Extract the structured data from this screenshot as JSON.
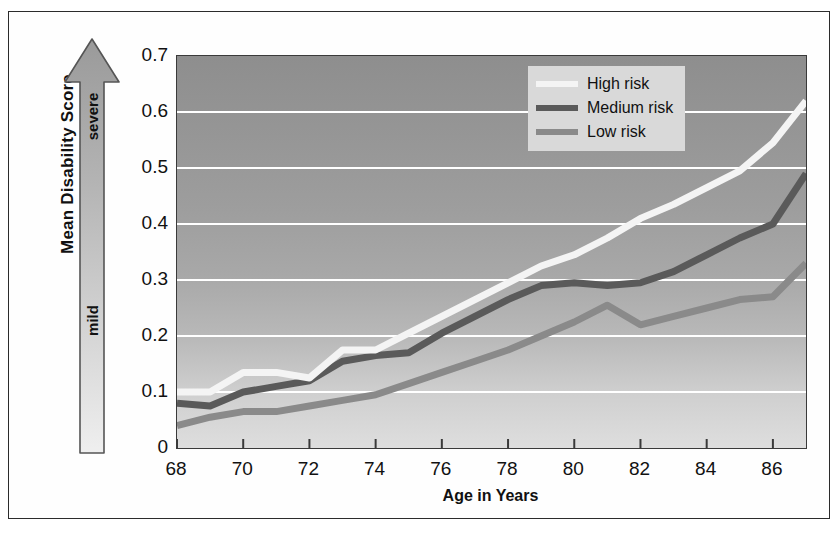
{
  "figure": {
    "y_axis_title": "Mean Disability Score",
    "x_axis_title": "Age in Years",
    "arrow_top_label": "severe",
    "arrow_bottom_label": "mild"
  },
  "colors": {
    "high_risk": "#f4f4f4",
    "medium_risk": "#5a5a5a",
    "low_risk": "#808080",
    "gridline": "#ffffff",
    "axis": "#3a3a3a",
    "legend_background": "#d9d9d9",
    "frame": "#2b2b2b"
  },
  "legend": {
    "items": [
      {
        "label": "High risk",
        "color": "#f4f4f4"
      },
      {
        "label": "Medium risk",
        "color": "#5a5a5a"
      },
      {
        "label": "Low risk",
        "color": "#8a8a8a"
      }
    ]
  },
  "chart_data": {
    "type": "line",
    "title": "",
    "xlabel": "Age in Years",
    "ylabel": "Mean Disability Score",
    "xlim": [
      68,
      87
    ],
    "ylim": [
      0,
      0.7
    ],
    "grid": true,
    "legend_position": "top-right",
    "x_ticks": [
      68,
      70,
      72,
      74,
      76,
      78,
      80,
      82,
      84,
      86
    ],
    "y_ticks": [
      0,
      0.1,
      0.2,
      0.3,
      0.4,
      0.5,
      0.6,
      0.7
    ],
    "y_tick_labels": [
      "0",
      "0.1",
      "0.2",
      "0.3",
      "0.4",
      "0.5",
      "0.6",
      "0.7"
    ],
    "x": [
      68,
      69,
      70,
      71,
      72,
      73,
      74,
      75,
      76,
      77,
      78,
      79,
      80,
      81,
      82,
      83,
      84,
      85,
      86,
      87
    ],
    "series": [
      {
        "name": "High risk",
        "color": "#f4f4f4",
        "values": [
          0.1,
          0.1,
          0.135,
          0.135,
          0.125,
          0.175,
          0.175,
          0.205,
          0.235,
          0.265,
          0.295,
          0.325,
          0.345,
          0.375,
          0.41,
          0.435,
          0.465,
          0.495,
          0.545,
          0.62
        ]
      },
      {
        "name": "Medium risk",
        "color": "#5a5a5a",
        "values": [
          0.08,
          0.075,
          0.1,
          0.11,
          0.12,
          0.155,
          0.165,
          0.17,
          0.205,
          0.235,
          0.265,
          0.29,
          0.295,
          0.29,
          0.295,
          0.315,
          0.345,
          0.375,
          0.4,
          0.49
        ]
      },
      {
        "name": "Low risk",
        "color": "#8a8a8a",
        "values": [
          0.04,
          0.055,
          0.065,
          0.065,
          0.075,
          0.085,
          0.095,
          0.115,
          0.135,
          0.155,
          0.175,
          0.2,
          0.225,
          0.255,
          0.22,
          0.235,
          0.25,
          0.265,
          0.27,
          0.33
        ]
      }
    ]
  }
}
